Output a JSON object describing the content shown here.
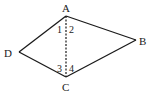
{
  "diagram": {
    "type": "quadrilateral",
    "vertices": {
      "A": {
        "label": "A",
        "x": 66,
        "y": 16
      },
      "B": {
        "label": "B",
        "x": 136,
        "y": 40
      },
      "C": {
        "label": "C",
        "x": 66,
        "y": 77
      },
      "D": {
        "label": "D",
        "x": 19,
        "y": 52
      }
    },
    "edges": [
      [
        "A",
        "B"
      ],
      [
        "B",
        "C"
      ],
      [
        "C",
        "D"
      ],
      [
        "D",
        "A"
      ]
    ],
    "diagonal": {
      "from": "A",
      "to": "C",
      "style": "dashed"
    },
    "angle_labels": [
      "1",
      "2",
      "3",
      "4"
    ],
    "colors": {
      "stroke": "#1a1a1a",
      "background": "#ffffff"
    }
  }
}
